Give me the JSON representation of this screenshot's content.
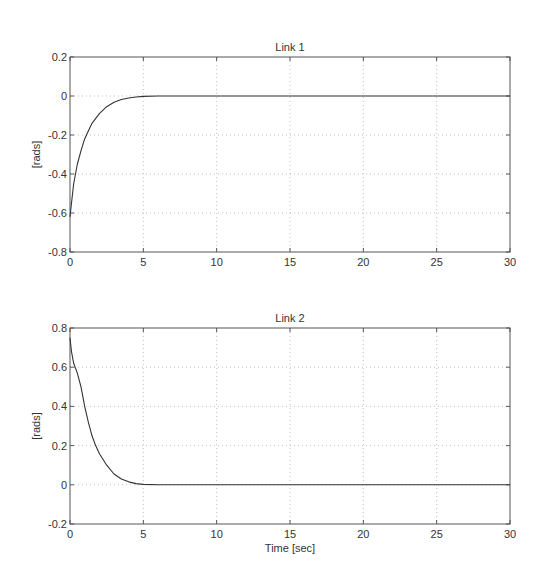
{
  "chart_data": [
    {
      "type": "line",
      "title": "Link 1",
      "xlabel": "",
      "ylabel": "[rads]",
      "xlim": [
        0,
        30
      ],
      "ylim": [
        -0.8,
        0.2
      ],
      "xticks": [
        0,
        5,
        10,
        15,
        20,
        25,
        30
      ],
      "yticks": [
        -0.8,
        -0.6,
        -0.4,
        -0.2,
        0,
        0.2
      ],
      "ytick_labels": [
        "-0.8",
        "-0.6",
        "-0.4",
        "-0.2",
        "0",
        "0.2"
      ],
      "grid": true,
      "series": [
        {
          "name": "Link 1",
          "x": [
            0,
            0.1,
            0.25,
            0.5,
            0.75,
            1.0,
            1.25,
            1.5,
            2.0,
            2.5,
            3.0,
            3.5,
            4.0,
            4.5,
            5.0,
            6.0,
            8.0,
            10,
            15,
            20,
            25,
            30
          ],
          "y": [
            -0.62,
            -0.55,
            -0.45,
            -0.35,
            -0.28,
            -0.22,
            -0.18,
            -0.14,
            -0.09,
            -0.055,
            -0.032,
            -0.018,
            -0.01,
            -0.005,
            -0.002,
            0,
            0,
            0,
            0,
            0,
            0,
            0
          ]
        }
      ]
    },
    {
      "type": "line",
      "title": "Link 2",
      "xlabel": "Time [sec]",
      "ylabel": "[rads]",
      "xlim": [
        0,
        30
      ],
      "ylim": [
        -0.2,
        0.8
      ],
      "xticks": [
        0,
        5,
        10,
        15,
        20,
        25,
        30
      ],
      "yticks": [
        -0.2,
        0,
        0.2,
        0.4,
        0.6,
        0.8
      ],
      "ytick_labels": [
        "-0.2",
        "0",
        "0.2",
        "0.4",
        "0.6",
        "0.8"
      ],
      "grid": true,
      "series": [
        {
          "name": "Link 2",
          "x": [
            0,
            0.1,
            0.25,
            0.5,
            0.75,
            1.0,
            1.25,
            1.5,
            1.75,
            2.0,
            2.5,
            3.0,
            3.5,
            4.0,
            4.5,
            5.0,
            6.0,
            8.0,
            10,
            15,
            20,
            25,
            30
          ],
          "y": [
            0.75,
            0.68,
            0.62,
            0.57,
            0.5,
            0.4,
            0.32,
            0.25,
            0.2,
            0.16,
            0.1,
            0.055,
            0.03,
            0.015,
            0.006,
            0.002,
            0,
            0,
            0,
            0,
            0,
            0,
            0
          ]
        }
      ]
    }
  ]
}
